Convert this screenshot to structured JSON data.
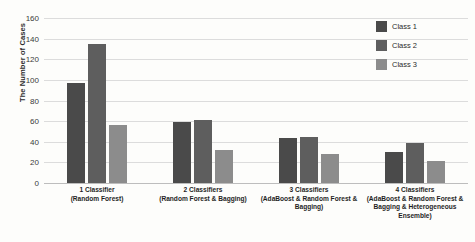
{
  "chart_data": {
    "type": "bar",
    "title": "",
    "xlabel": "",
    "ylabel": "The Number of Cases",
    "ylim": [
      0,
      160
    ],
    "ytick_step": 20,
    "yticks": [
      160,
      140,
      120,
      100,
      80,
      60,
      40,
      20,
      0
    ],
    "grid": true,
    "legend_position": "top-right",
    "categories": [
      "1 Classifier",
      "2 Classifiers",
      "3 Classifiers",
      "4 Classifiers"
    ],
    "category_sublabels": [
      "(Random Forest)",
      "(Random Forest & Bagging)",
      "(AdaBoost & Random Forest & Bagging)",
      "(AdaBoost & Random Forest & Bagging & Heterogeneous Ensemble)"
    ],
    "series": [
      {
        "name": "Class 1",
        "color": "#4a4a4a",
        "values": [
          97,
          59,
          44,
          30
        ]
      },
      {
        "name": "Class 2",
        "color": "#5e5e5e",
        "values": [
          135,
          61,
          45,
          39
        ]
      },
      {
        "name": "Class 3",
        "color": "#8c8c8c",
        "values": [
          56,
          32,
          28,
          21
        ]
      }
    ]
  },
  "axis": {
    "y_title": "The Number of Cases"
  }
}
